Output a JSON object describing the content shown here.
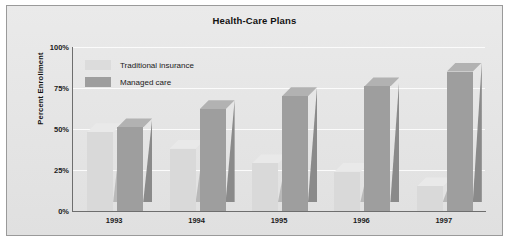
{
  "chart_data": {
    "type": "bar",
    "title": "Health-Care Plans",
    "xlabel": "",
    "ylabel": "Percent Enrollment",
    "categories": [
      "1993",
      "1994",
      "1995",
      "1996",
      "1997"
    ],
    "series": [
      {
        "name": "Traditional insurance",
        "values": [
          48,
          38,
          29,
          24,
          15
        ],
        "color": "#d9d9d9"
      },
      {
        "name": "Managed care",
        "values": [
          51,
          62,
          70,
          76,
          85
        ],
        "color": "#9e9e9e"
      }
    ],
    "ylim": [
      0,
      100
    ],
    "yticks": [
      "0%",
      "25%",
      "50%",
      "75%",
      "100%"
    ],
    "ytick_values": [
      0,
      25,
      50,
      75,
      100
    ],
    "grid": true,
    "legend_position": "top-left",
    "unit": "%"
  },
  "legend": {
    "items": [
      {
        "label": "Traditional insurance",
        "swatch": "light-gray-swatch"
      },
      {
        "label": "Managed care",
        "swatch": "medium-gray-swatch"
      }
    ]
  },
  "colors": {
    "frame_border": "#9a9a9a",
    "plot_background": "#e6e6e6",
    "gridline": "#fbfbfb",
    "axis": "#6e6e6e",
    "text": "#121212"
  }
}
